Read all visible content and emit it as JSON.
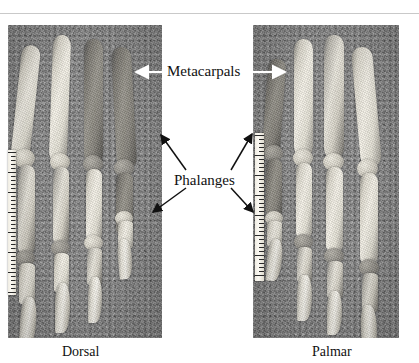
{
  "figure": {
    "type": "anatomical-photograph-plate",
    "background_color": "#ffffff",
    "photo_background_color": "#8d8d8d",
    "bone_color": "#e9e6dc",
    "annotation_text_color": "#111111",
    "white_arrow_color": "#ffffff",
    "black_arrow_color": "#111111"
  },
  "annotations": {
    "metacarpals": {
      "label": "Metacarpals",
      "arrow_left": "white-arrow-pointing-left",
      "arrow_right": "white-arrow-pointing-right"
    },
    "phalanges": {
      "label": "Phalanges",
      "arrow_upper_left": "black-arrow-pointing-upper-left",
      "arrow_lower_left": "black-arrow-pointing-lower-left",
      "arrow_upper_right": "black-arrow-pointing-upper-right",
      "arrow_lower_right": "black-arrow-pointing-lower-right"
    }
  },
  "panels": [
    {
      "id": "dorsal",
      "caption": "Dorsal",
      "ruler": "scale-ruler-left-edge",
      "digit_count": 4
    },
    {
      "id": "palmar",
      "caption": "Palmar",
      "ruler": "scale-ruler-left-edge",
      "digit_count": 4
    }
  ]
}
